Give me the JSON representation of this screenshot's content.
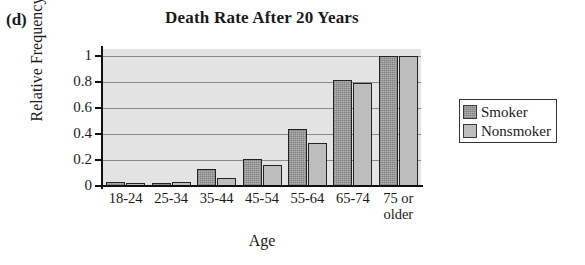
{
  "panel": {
    "label": "(d)"
  },
  "chart_data": {
    "type": "bar",
    "title": "Death Rate After 20 Years",
    "xlabel": "Age",
    "ylabel": "Relative Frequency",
    "ylim": [
      0,
      1.05
    ],
    "yticks": [
      "0",
      "0.2",
      "0.4",
      "0.6",
      "0.8",
      "1"
    ],
    "ytick_values": [
      0,
      0.2,
      0.4,
      0.6,
      0.8,
      1
    ],
    "grid": true,
    "legend_position": "right",
    "categories": [
      "18-24",
      "25-34",
      "35-44",
      "45-54",
      "55-64",
      "65-74",
      "75 or older"
    ],
    "series": [
      {
        "name": "Smoker",
        "color": "#b4b4b4",
        "values": [
          0.03,
          0.02,
          0.13,
          0.21,
          0.44,
          0.81,
          1.0
        ]
      },
      {
        "name": "Nonsmoker",
        "color": "#bdbdbd",
        "values": [
          0.02,
          0.03,
          0.06,
          0.16,
          0.33,
          0.79,
          1.0
        ]
      }
    ]
  }
}
